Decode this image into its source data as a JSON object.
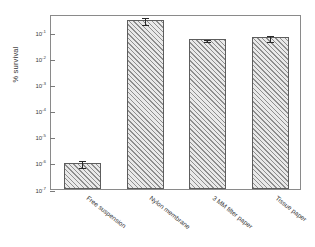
{
  "figure": {
    "background_color": "#ffffff",
    "frame_color": "#8a8a8a"
  },
  "chart_data": {
    "type": "bar",
    "title": "",
    "xlabel": "",
    "ylabel": "% survival",
    "yscale": "log",
    "ylim": [
      1e-07,
      0.5
    ],
    "grid": false,
    "legend": null,
    "categories": [
      "Free suspension",
      "Nylon membrane",
      "3 MM filter paper",
      "Tissue paper"
    ],
    "values": [
      1e-06,
      0.3,
      0.055,
      0.065
    ],
    "errors_upper": [
      4e-07,
      0.12,
      0.004,
      0.018
    ],
    "errors_lower": [
      2.5e-07,
      0.08,
      0.003,
      0.013
    ],
    "ytick_labels": [
      "10-1",
      "10-2",
      "10-3",
      "10-4",
      "10-5",
      "10-6",
      "10-7"
    ],
    "ytick_values": [
      0.1,
      0.01,
      0.001,
      0.0001,
      1e-05,
      1e-06,
      1e-07
    ],
    "ytick_mantissas": [
      "10",
      "10",
      "10",
      "10",
      "10",
      "10",
      "10"
    ],
    "ytick_exponents": [
      "-1",
      "-2",
      "-3",
      "-4",
      "-5",
      "-6",
      "-7"
    ],
    "bar_fill": "#e9e9e9",
    "bar_hatch": "diagonal-lines",
    "bar_edge_color": "#5d5d5d",
    "error_bar_color": "#2a2a2a"
  }
}
